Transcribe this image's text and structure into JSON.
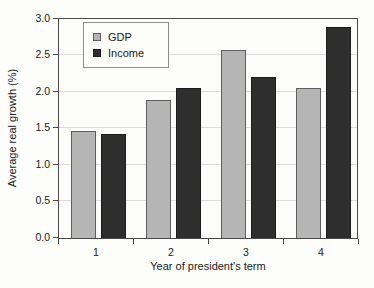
{
  "chart_data": {
    "type": "bar",
    "title": "",
    "xlabel": "Year of president's term",
    "ylabel": "Average real growth (%)",
    "categories": [
      "1",
      "2",
      "3",
      "4"
    ],
    "series": [
      {
        "name": "GDP",
        "color": "#b5b5b5",
        "border_color": "#5e5e5e",
        "values": [
          1.47,
          1.89,
          2.58,
          2.06
        ]
      },
      {
        "name": "Income",
        "color": "#2e2e2e",
        "border_color": "#1c1c1c",
        "values": [
          1.42,
          2.05,
          2.2,
          2.89
        ]
      }
    ],
    "ylim": [
      0.0,
      3.0
    ],
    "ytick_labels": [
      "0.0",
      "0.5",
      "1.0",
      "1.5",
      "2.0",
      "2.5",
      "3.0"
    ],
    "grid": "horizontal",
    "legend_position": "upper-left-inside",
    "colors": {
      "plot_border": "#4a4a4a",
      "gridline": "#ddddd8",
      "background": "#fdfdfb",
      "text": "#1a1a1a"
    }
  }
}
